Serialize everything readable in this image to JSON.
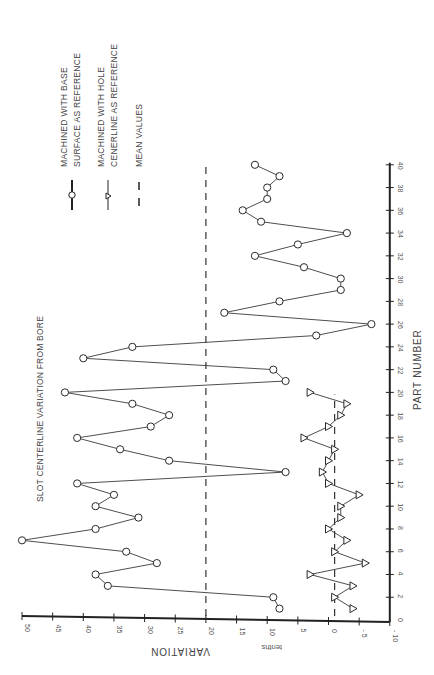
{
  "chart_data": {
    "type": "line",
    "title": "SLOT CENTERLINE VARIATION FROM BORE",
    "xlabel": "PART NUMBER",
    "ylabel": "VARIATION",
    "yunit": "tenths",
    "orientation": "rotated 90 degrees (part number axis vertical on right, variation axis horizontal at bottom, 50 at left)",
    "xlim": [
      0,
      40
    ],
    "ylim": [
      -10,
      50
    ],
    "x_ticks": [
      2,
      4,
      6,
      8,
      10,
      12,
      14,
      16,
      18,
      20,
      22,
      24,
      26,
      28,
      30,
      32,
      34,
      36,
      38,
      40
    ],
    "y_ticks": [
      50,
      45,
      40,
      35,
      30,
      25,
      20,
      15,
      10,
      5,
      0,
      -5,
      -10
    ],
    "y_tick_labels": [
      "50",
      "45",
      "40",
      "35",
      "30",
      "25",
      "20",
      "15",
      "10",
      "5",
      "0",
      "- 5",
      "- 10"
    ],
    "x_origin_label": "0",
    "grid": false,
    "series": [
      {
        "name": "MACHINED WITH BASE SURFACE AS REFERENCE",
        "marker": "circle",
        "x": [
          1,
          2,
          3,
          4,
          5,
          6,
          7,
          8,
          9,
          10,
          11,
          12,
          13,
          14,
          15,
          16,
          17,
          18,
          19,
          20,
          21,
          22,
          23,
          24,
          25,
          26,
          27,
          28,
          29,
          30,
          31,
          32,
          33,
          34,
          35,
          36,
          37,
          38,
          39,
          40
        ],
        "values": [
          8,
          9,
          36,
          38,
          28,
          33,
          50,
          38,
          31,
          38,
          35,
          41,
          7,
          26,
          34,
          41,
          29,
          26,
          32,
          43,
          7,
          9,
          40,
          32,
          2,
          -7,
          17,
          8,
          -2,
          -2,
          4,
          12,
          5,
          -3,
          11,
          14,
          10,
          10,
          8,
          12
        ]
      },
      {
        "name": "MACHINED WITH HOLE CENERLINE AS REFERENCE",
        "marker": "triangle",
        "x": [
          1,
          2,
          3,
          4,
          5,
          6,
          7,
          8,
          9,
          10,
          11,
          12,
          13,
          14,
          15,
          16,
          17,
          18,
          19,
          20
        ],
        "values": [
          -4,
          -1,
          -4,
          3,
          -6,
          -1,
          -3,
          0,
          -2,
          -2,
          -5,
          0,
          1,
          0,
          -1,
          4,
          0,
          -2,
          -3,
          3
        ]
      }
    ],
    "mean_lines": [
      {
        "series": "MACHINED WITH BASE SURFACE AS REFERENCE",
        "value": 20,
        "x_range": [
          0,
          40
        ],
        "style": "dashed"
      },
      {
        "series": "MACHINED WITH HOLE CENERLINE AS REFERENCE",
        "value": -1,
        "x_range": [
          0,
          20
        ],
        "style": "dashed"
      }
    ],
    "legend": {
      "position": "top-left (rotated)",
      "entries": [
        {
          "lines": [
            "MACHINED WITH BASE",
            "SURFACE  AS REFERENCE"
          ],
          "symbol": "circle-line"
        },
        {
          "lines": [
            "MACHINED WITH HOLE",
            "CENERLINE AS REFERENCE"
          ],
          "symbol": "triangle-line"
        },
        {
          "lines": [
            "MEAN VALUES"
          ],
          "symbol": "dash"
        }
      ]
    }
  },
  "labels": {
    "title": "SLOT CENTERLINE VARIATION FROM BORE",
    "xlabel": "PART NUMBER",
    "ylabel": "VARIATION",
    "unit": "tenths",
    "legend_1_line_1": "MACHINED WITH BASE",
    "legend_1_line_2": "SURFACE  AS REFERENCE",
    "legend_2_line_1": "MACHINED WITH HOLE",
    "legend_2_line_2": "CENERLINE AS REFERENCE",
    "legend_3_line_1": "MEAN VALUES"
  },
  "colors": {
    "ink": "#3a3a3a",
    "axis": "#222222",
    "background": "#ffffff"
  }
}
